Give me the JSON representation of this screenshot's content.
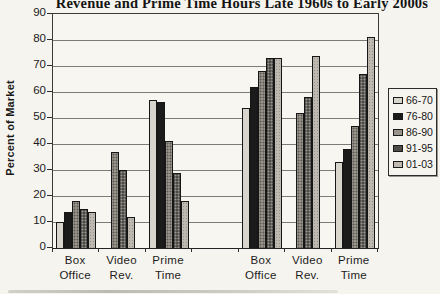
{
  "chart_data": {
    "type": "bar",
    "title": "Revenue and Prime Time Hours Late 1960s to Early 2000s",
    "ylabel": "Percent of Market",
    "xlabel": "",
    "ylim": [
      0,
      90
    ],
    "ytick_interval": 10,
    "grid": true,
    "legend_position": "right",
    "categories": [
      "Box Office",
      "Video Rev.",
      "Prime Time",
      "Box Office",
      "Video Rev.",
      "Prime Time"
    ],
    "category_gap_after_index": 2,
    "series": [
      {
        "name": "66-70",
        "color": "#d8d5cd",
        "values": [
          10,
          0,
          57,
          54,
          0,
          33
        ]
      },
      {
        "name": "76-80",
        "color": "#1b1b1b",
        "values": [
          14,
          0,
          56,
          62,
          0,
          38
        ]
      },
      {
        "name": "86-90",
        "color": "#98948b",
        "values": [
          18,
          37,
          41,
          68,
          52,
          47
        ]
      },
      {
        "name": "91-95",
        "color": "#4e4b47",
        "values": [
          15,
          30,
          29,
          73,
          58,
          67
        ]
      },
      {
        "name": "01-03",
        "color": "#beb9b0",
        "values": [
          14,
          12,
          18,
          73,
          74,
          81
        ]
      }
    ]
  },
  "colors": {
    "paper": "#f6f4ef",
    "grid": "#7c7b77",
    "axis": "#2f2f2f",
    "text": "#1c1c1c"
  }
}
